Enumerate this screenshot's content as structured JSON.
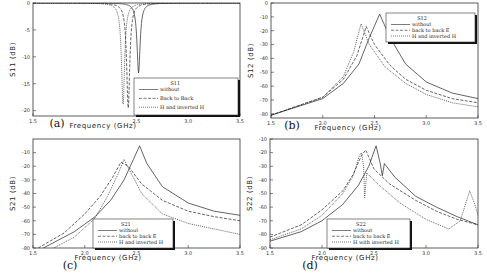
{
  "chart_data": [
    {
      "type": "line",
      "panel": "(a)",
      "title": "",
      "xlabel": "Frequency (GHz)",
      "ylabel": "S11 (dB)",
      "xlim": [
        1.5,
        3.5
      ],
      "ylim": [
        -21,
        0
      ],
      "xticks": [
        "1.5",
        "2.5",
        "3.0",
        "3.5"
      ],
      "yticks": [
        "0",
        "-5",
        "-10",
        "-15",
        "-20"
      ],
      "legend": {
        "title": "S11",
        "position": "lower right",
        "entries": [
          "without",
          "Back to Back",
          "H and inverted H"
        ]
      },
      "series": [
        {
          "name": "without",
          "style": "solid",
          "resonance_x": 2.52,
          "min_y": -13
        },
        {
          "name": "Back to Back",
          "style": "dashed",
          "resonance_x": 2.42,
          "min_y": -19.5
        },
        {
          "name": "H and inverted H",
          "style": "dotted",
          "resonance_x": 2.37,
          "min_y": -19
        }
      ]
    },
    {
      "type": "line",
      "panel": "(b)",
      "xlabel": "Frequency (GHz)",
      "ylabel": "S12 (dB)",
      "xlim": [
        1.5,
        3.5
      ],
      "ylim": [
        -83,
        0
      ],
      "xticks": [
        "1.5",
        "2.0",
        "2.5",
        "3.0",
        "3.5"
      ],
      "yticks": [
        "0",
        "-10",
        "-20",
        "-30",
        "-40",
        "-50",
        "-60",
        "-70",
        "-80"
      ],
      "legend": {
        "title": "S12",
        "position": "upper right",
        "entries": [
          "without",
          "back to back E",
          "H and inverted H"
        ]
      },
      "series": [
        {
          "name": "without",
          "style": "solid",
          "points": [
            [
              1.5,
              -81
            ],
            [
              2.0,
              -69
            ],
            [
              2.2,
              -58
            ],
            [
              2.35,
              -44
            ],
            [
              2.45,
              -25
            ],
            [
              2.55,
              -8
            ],
            [
              2.65,
              -25
            ],
            [
              2.8,
              -44
            ],
            [
              3.0,
              -57
            ],
            [
              3.25,
              -65
            ],
            [
              3.5,
              -69
            ]
          ]
        },
        {
          "name": "back to back E",
          "style": "dashed",
          "points": [
            [
              1.5,
              -81
            ],
            [
              2.0,
              -68
            ],
            [
              2.2,
              -55
            ],
            [
              2.33,
              -38
            ],
            [
              2.42,
              -17
            ],
            [
              2.5,
              -30
            ],
            [
              2.65,
              -45
            ],
            [
              2.8,
              -55
            ],
            [
              3.0,
              -63
            ],
            [
              3.25,
              -69
            ],
            [
              3.5,
              -72
            ]
          ]
        },
        {
          "name": "H and inverted H",
          "style": "dotted",
          "points": [
            [
              1.5,
              -81
            ],
            [
              2.0,
              -68
            ],
            [
              2.2,
              -53
            ],
            [
              2.3,
              -35
            ],
            [
              2.37,
              -15
            ],
            [
              2.45,
              -30
            ],
            [
              2.6,
              -46
            ],
            [
              2.8,
              -58
            ],
            [
              3.0,
              -66
            ],
            [
              3.25,
              -72
            ],
            [
              3.5,
              -75
            ]
          ]
        }
      ]
    },
    {
      "type": "line",
      "panel": "(c)",
      "xlabel": "Frequency (GHz)",
      "ylabel": "S21 (dB)",
      "xlim": [
        1.5,
        3.5
      ],
      "ylim": [
        -80,
        0
      ],
      "xticks": [
        "1.5",
        "2.0",
        "2.5",
        "3.0",
        "3.5"
      ],
      "yticks": [
        "-10",
        "-20",
        "-30",
        "-40",
        "-50",
        "-60",
        "-70",
        "-80"
      ],
      "legend": {
        "title": "S21",
        "position": "lower center",
        "entries": [
          "without",
          "back to back E",
          "H and inverted H"
        ]
      },
      "series": [
        {
          "name": "without",
          "style": "solid",
          "points": [
            [
              1.6,
              -80
            ],
            [
              1.9,
              -68
            ],
            [
              2.1,
              -57
            ],
            [
              2.25,
              -45
            ],
            [
              2.38,
              -30
            ],
            [
              2.47,
              -15
            ],
            [
              2.53,
              -5
            ],
            [
              2.6,
              -18
            ],
            [
              2.75,
              -35
            ],
            [
              3.0,
              -47
            ],
            [
              3.25,
              -53
            ],
            [
              3.5,
              -56
            ]
          ]
        },
        {
          "name": "back to back E",
          "style": "dashed",
          "points": [
            [
              1.55,
              -80
            ],
            [
              1.8,
              -69
            ],
            [
              2.0,
              -55
            ],
            [
              2.15,
              -42
            ],
            [
              2.27,
              -28
            ],
            [
              2.35,
              -17
            ],
            [
              2.42,
              -20
            ],
            [
              2.55,
              -33
            ],
            [
              2.75,
              -45
            ],
            [
              3.0,
              -53
            ],
            [
              3.25,
              -57
            ],
            [
              3.5,
              -60
            ]
          ]
        },
        {
          "name": "H and inverted H",
          "style": "dotted",
          "points": [
            [
              1.7,
              -80
            ],
            [
              1.9,
              -72
            ],
            [
              2.1,
              -58
            ],
            [
              2.22,
              -42
            ],
            [
              2.32,
              -26
            ],
            [
              2.38,
              -15
            ],
            [
              2.44,
              -24
            ],
            [
              2.55,
              -40
            ],
            [
              2.75,
              -55
            ],
            [
              3.0,
              -62
            ],
            [
              3.25,
              -66
            ],
            [
              3.5,
              -70
            ]
          ]
        }
      ]
    },
    {
      "type": "line",
      "panel": "(d)",
      "xlabel": "Frequency (GHz)",
      "ylabel": "S22 (dB)",
      "xlim": [
        1.5,
        3.5
      ],
      "ylim": [
        -90,
        -10
      ],
      "xticks": [
        "1.5",
        "2.0",
        "2.5",
        "3.0",
        "3.5"
      ],
      "yticks": [
        "-10",
        "-20",
        "-30",
        "-40",
        "-50",
        "-60",
        "-70",
        "-80",
        "-90"
      ],
      "legend": {
        "title": "S22",
        "position": "lower center",
        "entries": [
          "without",
          "back to back E",
          "H with inverted H"
        ]
      },
      "series": [
        {
          "name": "without",
          "style": "solid",
          "points": [
            [
              1.5,
              -85
            ],
            [
              1.8,
              -78
            ],
            [
              2.0,
              -70
            ],
            [
              2.2,
              -58
            ],
            [
              2.35,
              -44
            ],
            [
              2.45,
              -30
            ],
            [
              2.52,
              -15
            ],
            [
              2.56,
              -28
            ],
            [
              2.58,
              -37
            ],
            [
              2.6,
              -28
            ],
            [
              2.7,
              -38
            ],
            [
              2.9,
              -52
            ],
            [
              3.1,
              -60
            ],
            [
              3.3,
              -67
            ],
            [
              3.5,
              -73
            ]
          ]
        },
        {
          "name": "back to back E",
          "style": "dashed",
          "points": [
            [
              1.5,
              -82
            ],
            [
              1.8,
              -73
            ],
            [
              2.0,
              -62
            ],
            [
              2.2,
              -48
            ],
            [
              2.3,
              -36
            ],
            [
              2.38,
              -22
            ],
            [
              2.42,
              -18
            ],
            [
              2.5,
              -32
            ],
            [
              2.65,
              -43
            ],
            [
              2.9,
              -55
            ],
            [
              3.1,
              -63
            ],
            [
              3.3,
              -69
            ],
            [
              3.5,
              -73
            ]
          ]
        },
        {
          "name": "H with inverted H",
          "style": "dotted",
          "points": [
            [
              1.5,
              -84
            ],
            [
              1.8,
              -76
            ],
            [
              2.0,
              -66
            ],
            [
              2.2,
              -50
            ],
            [
              2.3,
              -37
            ],
            [
              2.36,
              -22
            ],
            [
              2.38,
              -20
            ],
            [
              2.4,
              -30
            ],
            [
              2.41,
              -53
            ],
            [
              2.43,
              -35
            ],
            [
              2.55,
              -44
            ],
            [
              2.75,
              -57
            ],
            [
              3.0,
              -69
            ],
            [
              3.22,
              -76
            ],
            [
              3.33,
              -70
            ],
            [
              3.42,
              -48
            ],
            [
              3.47,
              -58
            ],
            [
              3.5,
              -66
            ]
          ]
        }
      ]
    }
  ],
  "panels": {
    "a": {
      "label": "(a)",
      "xlabel": "Frequency (GHz)",
      "ylabel": "S11 (dB)",
      "legend_title": "S11",
      "legend": [
        "without",
        "Back to Back",
        "H and inverted H"
      ]
    },
    "b": {
      "label": "(b)",
      "xlabel": "Frequency (GHz)",
      "ylabel": "S12 (dB)",
      "legend_title": "S12",
      "legend": [
        "without",
        "back to back E",
        "H and inverted H"
      ]
    },
    "c": {
      "label": "(c)",
      "xlabel": "Frequency (GHz)",
      "ylabel": "S21 (dB)",
      "legend_title": "S21",
      "legend": [
        "without",
        "back to back E",
        "H and inverted H"
      ]
    },
    "d": {
      "label": "(d)",
      "xlabel": "Frequency (GHz)",
      "ylabel": "S22 (dB)",
      "legend_title": "S22",
      "legend": [
        "without",
        "back to back E",
        "H with inverted H"
      ]
    }
  }
}
